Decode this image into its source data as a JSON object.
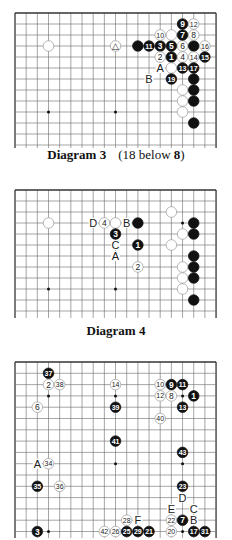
{
  "diagrams": [
    {
      "id": "diagram-3",
      "caption_title": "Diagram 3",
      "caption_note_prefix": "(18 below ",
      "caption_note_bold": "8",
      "caption_note_suffix": ")",
      "top": 13,
      "left": 15,
      "cols": 19,
      "rows": 13,
      "dx": 11.17,
      "dy": 11.0,
      "open_bottom": true,
      "svg_top": 0,
      "svg_height": 150,
      "caption_y": 147,
      "hoshi": [
        [
          3,
          9
        ],
        [
          9,
          9
        ]
      ],
      "stones": [
        {
          "c": 3,
          "r": 3,
          "color": "white",
          "label": ""
        },
        {
          "c": 9,
          "r": 3,
          "color": "white",
          "label": "△"
        },
        {
          "c": 11,
          "r": 3,
          "color": "black",
          "label": ""
        },
        {
          "c": 12,
          "r": 3,
          "color": "black",
          "label": "11"
        },
        {
          "c": 13,
          "r": 3,
          "color": "black",
          "label": "3"
        },
        {
          "c": 14,
          "r": 3,
          "color": "black",
          "label": "5"
        },
        {
          "c": 15,
          "r": 3,
          "color": "white",
          "label": "6"
        },
        {
          "c": 16,
          "r": 3,
          "color": "black",
          "label": ""
        },
        {
          "c": 17,
          "r": 3,
          "color": "white",
          "label": "16"
        },
        {
          "c": 15,
          "r": 1,
          "color": "black",
          "label": "9"
        },
        {
          "c": 16,
          "r": 1,
          "color": "white",
          "label": "12"
        },
        {
          "c": 13,
          "r": 2,
          "color": "white",
          "label": "10"
        },
        {
          "c": 14,
          "r": 2,
          "color": "white",
          "label": ""
        },
        {
          "c": 15,
          "r": 2,
          "color": "black",
          "label": "7"
        },
        {
          "c": 16,
          "r": 2,
          "color": "white",
          "label": "8"
        },
        {
          "c": 13,
          "r": 4,
          "color": "white",
          "label": "2"
        },
        {
          "c": 14,
          "r": 4,
          "color": "black",
          "label": "1"
        },
        {
          "c": 15,
          "r": 4,
          "color": "white",
          "label": "4"
        },
        {
          "c": 16,
          "r": 4,
          "color": "white",
          "label": "14"
        },
        {
          "c": 17,
          "r": 4,
          "color": "black",
          "label": "15"
        },
        {
          "c": 14,
          "r": 5,
          "color": "white",
          "label": ""
        },
        {
          "c": 15,
          "r": 5,
          "color": "black",
          "label": "13"
        },
        {
          "c": 16,
          "r": 5,
          "color": "black",
          "label": "17"
        },
        {
          "c": 14,
          "r": 6,
          "color": "black",
          "label": "19"
        },
        {
          "c": 16,
          "r": 6,
          "color": "black",
          "label": ""
        },
        {
          "c": 15,
          "r": 7,
          "color": "white",
          "label": ""
        },
        {
          "c": 16,
          "r": 7,
          "color": "black",
          "label": ""
        },
        {
          "c": 15,
          "r": 8,
          "color": "white",
          "label": ""
        },
        {
          "c": 16,
          "r": 8,
          "color": "black",
          "label": ""
        },
        {
          "c": 15,
          "r": 9,
          "color": "white",
          "label": ""
        },
        {
          "c": 16,
          "r": 10,
          "color": "black",
          "label": ""
        }
      ],
      "letters": [
        {
          "c": 13,
          "r": 5,
          "label": "A"
        },
        {
          "c": 12,
          "r": 6,
          "label": "B"
        }
      ]
    },
    {
      "id": "diagram-4",
      "caption_title": "Diagram 4",
      "caption_note_prefix": "",
      "caption_note_bold": "",
      "caption_note_suffix": "",
      "top": 190,
      "left": 15,
      "cols": 19,
      "rows": 12,
      "dx": 11.17,
      "dy": 11.0,
      "open_bottom": true,
      "svg_top": 180,
      "svg_height": 140,
      "caption_y": 323,
      "hoshi": [
        [
          3,
          9
        ],
        [
          9,
          9
        ],
        [
          15,
          3
        ]
      ],
      "stones": [
        {
          "c": 3,
          "r": 3,
          "color": "white",
          "label": ""
        },
        {
          "c": 8,
          "r": 3,
          "color": "white",
          "label": "4"
        },
        {
          "c": 9,
          "r": 3,
          "color": "white",
          "label": ""
        },
        {
          "c": 11,
          "r": 3,
          "color": "black",
          "label": ""
        },
        {
          "c": 9,
          "r": 4,
          "color": "black",
          "label": "3"
        },
        {
          "c": 11,
          "r": 5,
          "color": "black",
          "label": "1"
        },
        {
          "c": 11,
          "r": 7,
          "color": "white",
          "label": "2"
        },
        {
          "c": 14,
          "r": 2,
          "color": "white",
          "label": ""
        },
        {
          "c": 16,
          "r": 3,
          "color": "black",
          "label": ""
        },
        {
          "c": 15,
          "r": 4,
          "color": "white",
          "label": ""
        },
        {
          "c": 16,
          "r": 4,
          "color": "black",
          "label": ""
        },
        {
          "c": 14,
          "r": 5,
          "color": "white",
          "label": ""
        },
        {
          "c": 16,
          "r": 6,
          "color": "black",
          "label": ""
        },
        {
          "c": 15,
          "r": 7,
          "color": "white",
          "label": ""
        },
        {
          "c": 16,
          "r": 7,
          "color": "black",
          "label": ""
        },
        {
          "c": 15,
          "r": 8,
          "color": "white",
          "label": ""
        },
        {
          "c": 16,
          "r": 8,
          "color": "black",
          "label": ""
        },
        {
          "c": 15,
          "r": 9,
          "color": "white",
          "label": ""
        },
        {
          "c": 16,
          "r": 10,
          "color": "black",
          "label": ""
        }
      ],
      "letters": [
        {
          "c": 7,
          "r": 3,
          "label": "D"
        },
        {
          "c": 10,
          "r": 3,
          "label": "B"
        },
        {
          "c": 9,
          "r": 5,
          "label": "C"
        },
        {
          "c": 9,
          "r": 6,
          "label": "A"
        }
      ]
    },
    {
      "id": "diagram-5",
      "caption_title": "",
      "caption_note_prefix": "",
      "caption_note_bold": "",
      "caption_note_suffix": "",
      "top": 362,
      "left": 15,
      "cols": 19,
      "rows": 17,
      "dx": 11.17,
      "dy": 11.3,
      "open_bottom": true,
      "svg_top": 355,
      "svg_height": 185,
      "caption_y": null,
      "hoshi": [
        [
          3,
          3
        ],
        [
          9,
          3
        ],
        [
          15,
          3
        ],
        [
          9,
          9
        ],
        [
          15,
          9
        ],
        [
          3,
          15
        ],
        [
          15,
          15
        ]
      ],
      "stones": [
        {
          "c": 3,
          "r": 1,
          "color": "black",
          "label": "37"
        },
        {
          "c": 3,
          "r": 2,
          "color": "white",
          "label": "2"
        },
        {
          "c": 4,
          "r": 2,
          "color": "white",
          "label": "38"
        },
        {
          "c": 2,
          "r": 4,
          "color": "white",
          "label": "6"
        },
        {
          "c": 9,
          "r": 2,
          "color": "white",
          "label": "14"
        },
        {
          "c": 9,
          "r": 4,
          "color": "black",
          "label": "39"
        },
        {
          "c": 13,
          "r": 2,
          "color": "white",
          "label": "10"
        },
        {
          "c": 14,
          "r": 2,
          "color": "black",
          "label": "9"
        },
        {
          "c": 15,
          "r": 2,
          "color": "black",
          "label": "11"
        },
        {
          "c": 13,
          "r": 3,
          "color": "white",
          "label": "12"
        },
        {
          "c": 14,
          "r": 3,
          "color": "white",
          "label": "8"
        },
        {
          "c": 16,
          "r": 3,
          "color": "black",
          "label": "1"
        },
        {
          "c": 15,
          "r": 4,
          "color": "black",
          "label": "13"
        },
        {
          "c": 13,
          "r": 5,
          "color": "white",
          "label": "40"
        },
        {
          "c": 9,
          "r": 7,
          "color": "black",
          "label": "41"
        },
        {
          "c": 15,
          "r": 8,
          "color": "black",
          "label": "43"
        },
        {
          "c": 3,
          "r": 9,
          "color": "white",
          "label": "34"
        },
        {
          "c": 2,
          "r": 11,
          "color": "black",
          "label": "35"
        },
        {
          "c": 4,
          "r": 11,
          "color": "white",
          "label": "36"
        },
        {
          "c": 15,
          "r": 11,
          "color": "black",
          "label": "23"
        },
        {
          "c": 10,
          "r": 14,
          "color": "white",
          "label": "28"
        },
        {
          "c": 14,
          "r": 14,
          "color": "white",
          "label": "22"
        },
        {
          "c": 15,
          "r": 14,
          "color": "black",
          "label": "7"
        },
        {
          "c": 2,
          "r": 15,
          "color": "black",
          "label": "3"
        },
        {
          "c": 8,
          "r": 15,
          "color": "white",
          "label": "42"
        },
        {
          "c": 9,
          "r": 15,
          "color": "white",
          "label": "26"
        },
        {
          "c": 10,
          "r": 15,
          "color": "black",
          "label": "25"
        },
        {
          "c": 11,
          "r": 15,
          "color": "black",
          "label": "29"
        },
        {
          "c": 12,
          "r": 15,
          "color": "black",
          "label": "21"
        },
        {
          "c": 14,
          "r": 15,
          "color": "white",
          "label": "20"
        },
        {
          "c": 16,
          "r": 15,
          "color": "black",
          "label": "17"
        },
        {
          "c": 17,
          "r": 15,
          "color": "black",
          "label": "31"
        }
      ],
      "letters": [
        {
          "c": 2,
          "r": 9,
          "label": "A"
        },
        {
          "c": 15,
          "r": 12,
          "label": "D"
        },
        {
          "c": 14,
          "r": 13,
          "label": "E"
        },
        {
          "c": 16,
          "r": 13,
          "label": "C"
        },
        {
          "c": 11,
          "r": 14,
          "label": "F"
        },
        {
          "c": 16,
          "r": 14,
          "label": "B"
        }
      ]
    }
  ],
  "colors": {
    "grid": "#6a6a6a",
    "border": "#333333",
    "black_stone": "#111111",
    "white_stone": "#ffffff",
    "white_edge": "#9a9a9a",
    "label_on_black": "#ffffff",
    "label_on_white": "#222222",
    "letter": "#222222"
  }
}
